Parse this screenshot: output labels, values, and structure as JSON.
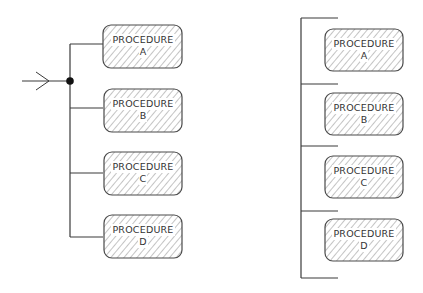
{
  "diagram": {
    "type": "flowchart",
    "left_structure": {
      "description": "Selection / case structure: single entry arrow to junction, branches to four procedures",
      "entry": "arrow",
      "junction": "filled-dot",
      "procedures": [
        {
          "line1": "PROCEDURE",
          "line2": "A"
        },
        {
          "line1": "PROCEDURE",
          "line2": "B"
        },
        {
          "line1": "PROCEDURE",
          "line2": "C"
        },
        {
          "line1": "PROCEDURE",
          "line2": "D"
        }
      ]
    },
    "right_structure": {
      "description": "Sequence bracket: procedures stacked between bracket ticks",
      "procedures": [
        {
          "line1": "PROCEDURE",
          "line2": "A"
        },
        {
          "line1": "PROCEDURE",
          "line2": "B"
        },
        {
          "line1": "PROCEDURE",
          "line2": "C"
        },
        {
          "line1": "PROCEDURE",
          "line2": "D"
        }
      ]
    },
    "colors": {
      "line": "#3a3a3a",
      "hatch": "#8a8a8a",
      "box_border": "#4a4a4a",
      "background": "#ffffff"
    }
  }
}
